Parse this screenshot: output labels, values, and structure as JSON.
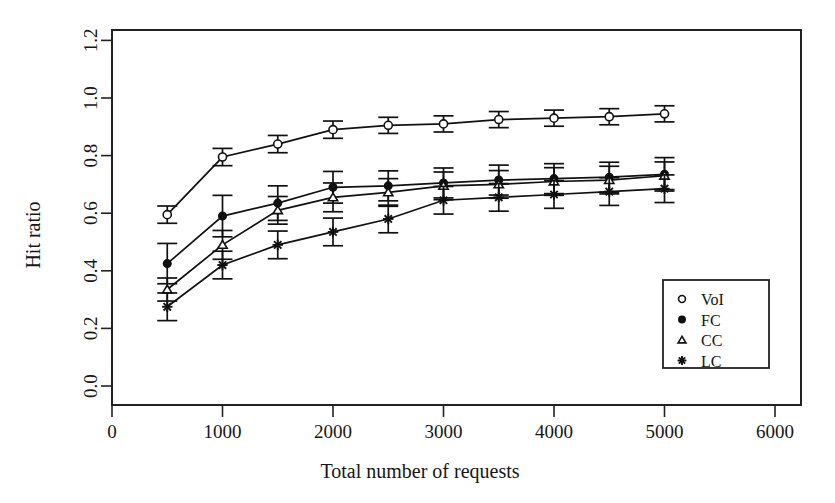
{
  "chart_data": {
    "type": "line",
    "title": "",
    "subtitle": "",
    "xlabel": "Total number of requests",
    "ylabel": "Hit ratio",
    "xlim": [
      0,
      6200
    ],
    "ylim": [
      0.0,
      1.25
    ],
    "xticks": [
      0,
      1000,
      2000,
      3000,
      4000,
      5000,
      6000
    ],
    "xtick_labels": [
      "0",
      "1000",
      "2000",
      "3000",
      "4000",
      "5000",
      "6000"
    ],
    "yticks": [
      0.0,
      0.2,
      0.4,
      0.6,
      0.8,
      1.0,
      1.2
    ],
    "ytick_labels": [
      "0.0",
      "0.2",
      "0.4",
      "0.6",
      "0.8",
      "1.0",
      "1.2"
    ],
    "grid": false,
    "legend_position": "lower-right",
    "error_bars": true,
    "x": [
      500,
      1000,
      1500,
      2000,
      2500,
      3000,
      3500,
      4000,
      4500,
      5000
    ],
    "series": [
      {
        "name": "VoI",
        "marker": "open-circle",
        "values": [
          0.595,
          0.795,
          0.84,
          0.89,
          0.905,
          0.91,
          0.925,
          0.93,
          0.935,
          0.945
        ],
        "errors": [
          0.03,
          0.03,
          0.03,
          0.03,
          0.028,
          0.028,
          0.028,
          0.028,
          0.028,
          0.028
        ]
      },
      {
        "name": "FC",
        "marker": "filled-circle",
        "values": [
          0.425,
          0.59,
          0.635,
          0.69,
          0.695,
          0.705,
          0.715,
          0.72,
          0.725,
          0.735
        ],
        "errors": [
          0.07,
          0.072,
          0.06,
          0.055,
          0.052,
          0.052,
          0.052,
          0.052,
          0.052,
          0.058
        ]
      },
      {
        "name": "CC",
        "marker": "open-triangle",
        "values": [
          0.335,
          0.49,
          0.61,
          0.655,
          0.672,
          0.695,
          0.7,
          0.71,
          0.715,
          0.73
        ],
        "errors": [
          0.04,
          0.05,
          0.048,
          0.05,
          0.048,
          0.048,
          0.048,
          0.048,
          0.048,
          0.048
        ]
      },
      {
        "name": "LC",
        "marker": "asterisk",
        "values": [
          0.275,
          0.42,
          0.49,
          0.535,
          0.58,
          0.645,
          0.655,
          0.665,
          0.675,
          0.685
        ],
        "errors": [
          0.048,
          0.048,
          0.048,
          0.048,
          0.048,
          0.048,
          0.048,
          0.048,
          0.048,
          0.048
        ]
      }
    ],
    "legend": [
      {
        "label": "VoI",
        "marker": "open-circle"
      },
      {
        "label": "FC",
        "marker": "filled-circle"
      },
      {
        "label": "CC",
        "marker": "open-triangle"
      },
      {
        "label": "LC",
        "marker": "asterisk"
      }
    ],
    "colors": {
      "foreground": "#111111",
      "background": "#ffffff"
    }
  }
}
